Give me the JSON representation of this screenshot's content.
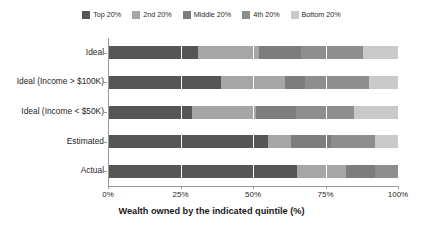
{
  "chart_data": {
    "type": "bar",
    "orientation": "horizontal",
    "stacked": true,
    "normalized": true,
    "title": "",
    "xlabel": "Wealth owned by the indicated quintile (%)",
    "ylabel": "",
    "xlim": [
      0,
      100
    ],
    "xticks": [
      0,
      25,
      50,
      75,
      100
    ],
    "xticklabels": [
      "0%",
      "25%",
      "50%",
      "75%",
      "100%"
    ],
    "grid": true,
    "grid_axis": "x",
    "legend_position": "top-center",
    "categories": [
      "Ideal",
      "Ideal (Income > $100K)",
      "Ideal (Income < $50K)",
      "Estimated",
      "Actual"
    ],
    "series": [
      {
        "name": "Top 20%",
        "color": "#565656",
        "values": [
          31.0,
          39.0,
          29.0,
          55.0,
          65.0
        ]
      },
      {
        "name": "2nd 20%",
        "color": "#a6a6a6",
        "values": [
          21.0,
          22.0,
          22.0,
          8.0,
          17.0
        ]
      },
      {
        "name": "Middle 20%",
        "color": "#7d7d7d",
        "values": [
          14.5,
          7.0,
          14.0,
          14.0,
          10.0
        ]
      },
      {
        "name": "4th 20%",
        "color": "#8e8e8e",
        "values": [
          21.5,
          22.0,
          20.0,
          15.0,
          8.0
        ]
      },
      {
        "name": "Bottom 20%",
        "color": "#c9c9c9",
        "values": [
          12.0,
          10.0,
          15.0,
          8.0,
          0.0
        ]
      }
    ]
  },
  "legend": {
    "items": [
      {
        "label": "Top 20%",
        "color": "#565656"
      },
      {
        "label": "2nd 20%",
        "color": "#a6a6a6"
      },
      {
        "label": "Middle 20%",
        "color": "#7d7d7d"
      },
      {
        "label": "4th 20%",
        "color": "#8e8e8e"
      },
      {
        "label": "Bottom 20%",
        "color": "#c9c9c9"
      }
    ]
  },
  "axes": {
    "x_title": "Wealth owned by the indicated quintile (%)",
    "x_tick_labels": [
      "0%",
      "25%",
      "50%",
      "75%",
      "100%"
    ],
    "y_tick_labels": [
      "Ideal",
      "Ideal (Income > $100K)",
      "Ideal (Income < $50K)",
      "Estimated",
      "Actual"
    ],
    "axis_color": "#9a9a9a",
    "grid_color": "#ffffff",
    "background": "#ffffff"
  }
}
